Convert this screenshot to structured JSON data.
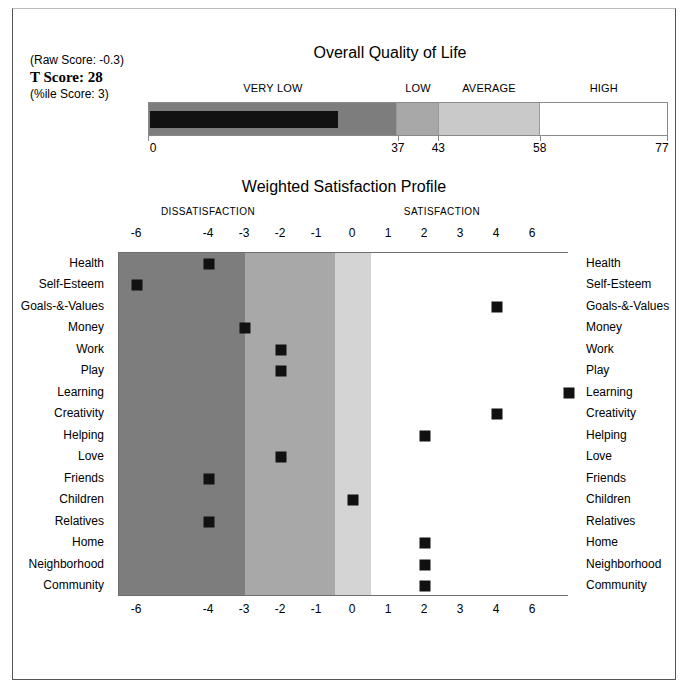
{
  "scores": {
    "raw_label": "(Raw Score:  -0.3)",
    "t_label": "T Score: 28",
    "pct_label": "(%ile Score: 3)"
  },
  "quality_of_life": {
    "title": "Overall Quality of Life",
    "categories": [
      {
        "label": "VERY LOW",
        "from": 0,
        "to": 37
      },
      {
        "label": "LOW",
        "from": 37,
        "to": 43
      },
      {
        "label": "AVERAGE",
        "from": 43,
        "to": 58
      },
      {
        "label": "HIGH",
        "from": 58,
        "to": 77
      }
    ],
    "ticks": [
      0,
      37,
      43,
      58,
      77
    ],
    "scale_min": 0,
    "scale_max": 77,
    "t_score": 28,
    "colors": {
      "very_low": "#7d7d7d",
      "low": "#a8a8a8",
      "average": "#c9c9c9",
      "high": "#ffffff",
      "score_bar": "#111111"
    }
  },
  "chart_data": {
    "type": "scatter",
    "title": "Weighted Satisfaction Profile",
    "xlabel": "",
    "ylabel": "",
    "grid": false,
    "side_headers": [
      "DISSATISFACTION",
      "SATISFACTION"
    ],
    "x_ticks": [
      -6,
      -4,
      -3,
      -2,
      -1,
      0,
      1,
      2,
      3,
      4,
      6
    ],
    "xlim": [
      -6.5,
      6.0
    ],
    "bands": [
      {
        "name": "severe-dissatisfaction",
        "from": -6.5,
        "to": -3.0,
        "color": "#7d7d7d"
      },
      {
        "name": "moderate-dissatisfaction",
        "from": -3.0,
        "to": -0.5,
        "color": "#a8a8a8"
      },
      {
        "name": "slight-dissatisfaction",
        "from": -0.5,
        "to": 0.5,
        "color": "#d4d4d4"
      },
      {
        "name": "satisfaction",
        "from": 0.5,
        "to": 6.0,
        "color": "#ffffff"
      }
    ],
    "categories": [
      "Health",
      "Self-Esteem",
      "Goals-&-Values",
      "Money",
      "Work",
      "Play",
      "Learning",
      "Creativity",
      "Helping",
      "Love",
      "Friends",
      "Children",
      "Relatives",
      "Home",
      "Neighborhood",
      "Community"
    ],
    "values": [
      -4,
      -6,
      4,
      -3,
      -2,
      -2,
      6,
      4,
      2,
      -2,
      -4,
      0,
      -4,
      2,
      2,
      2
    ],
    "marker_color": "#111111"
  }
}
